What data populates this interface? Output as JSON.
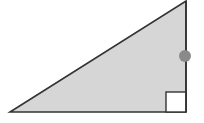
{
  "diagram": {
    "title": "Right triangle",
    "background": "#ffffff",
    "triangle": {
      "fill": "#d6d6d6",
      "stroke": "#333333",
      "vertices": {
        "bottom_left": [
          10,
          112
        ],
        "right_angle": [
          186,
          112
        ],
        "top": [
          186,
          1
        ]
      }
    },
    "right_angle_marker": {
      "x": 166,
      "y": 92,
      "size": 20,
      "fill": "#ffffff",
      "stroke": "#333333"
    },
    "point_marker": {
      "cx": 185,
      "cy": 56,
      "r": 6,
      "fill": "#8a8a8a"
    }
  }
}
